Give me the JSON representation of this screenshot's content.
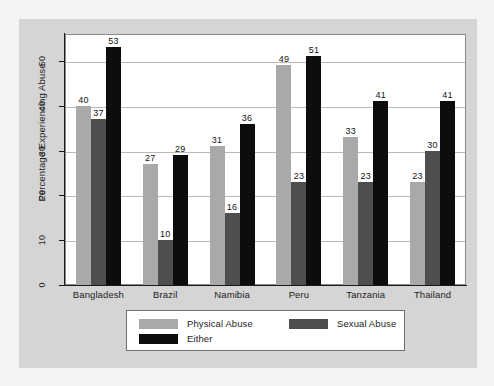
{
  "chart_data": {
    "type": "bar",
    "title": "",
    "xlabel": "",
    "ylabel": "Percentage Experiencing Abuse",
    "categories": [
      "Bangladesh",
      "Brazil",
      "Namibia",
      "Peru",
      "Tanzania",
      "Thailand"
    ],
    "series": [
      {
        "name": "Physical Abuse",
        "color": "#a9a9a9",
        "values": [
          40,
          27,
          31,
          49,
          33,
          23
        ]
      },
      {
        "name": "Sexual Abuse",
        "color": "#4e4e4e",
        "values": [
          37,
          10,
          16,
          23,
          23,
          30
        ]
      },
      {
        "name": "Either",
        "color": "#0d0d0d",
        "values": [
          53,
          29,
          36,
          51,
          41,
          41
        ]
      }
    ],
    "ylim": [
      0,
      56
    ],
    "yticks": [
      0,
      10,
      20,
      30,
      40,
      50
    ],
    "ytick_labels": [
      "0",
      "10",
      "20",
      "30",
      "40",
      "50"
    ],
    "grid": true,
    "show_value_labels": true,
    "legend_position": "below-axes"
  },
  "figure": {
    "background_color": "#d5d5d5",
    "plot_background_color": "#ffffff",
    "outer_background_color": "#f4f4f4"
  }
}
